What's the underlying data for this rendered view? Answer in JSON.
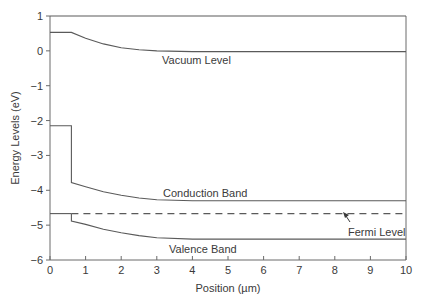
{
  "chart_data": {
    "type": "line",
    "title": "",
    "xlabel": "Position (µm)",
    "ylabel": "Energy Levels (eV)",
    "xlim": [
      0,
      10
    ],
    "ylim": [
      -6,
      1
    ],
    "xticks": [
      "0",
      "1",
      "2",
      "3",
      "4",
      "5",
      "6",
      "7",
      "8",
      "9",
      "10"
    ],
    "yticks": [
      "1",
      "0",
      "−1",
      "−2",
      "−3",
      "−4",
      "−5",
      "−6"
    ],
    "grid": false,
    "series": [
      {
        "name": "Vacuum Level",
        "label_position": [
          3.0,
          -0.25
        ],
        "points": [
          [
            0,
            0.53
          ],
          [
            0.6,
            0.53
          ],
          [
            1.0,
            0.36
          ],
          [
            1.5,
            0.2
          ],
          [
            2.0,
            0.09
          ],
          [
            2.5,
            0.03
          ],
          [
            3.0,
            0.0
          ],
          [
            4,
            -0.02
          ],
          [
            10,
            -0.02
          ]
        ],
        "style": "solid"
      },
      {
        "name": "Conduction Band",
        "label_position": [
          3.2,
          -4.05
        ],
        "points": [
          [
            0,
            -2.15
          ],
          [
            0.6,
            -2.15
          ],
          [
            0.6,
            -3.78
          ],
          [
            1.0,
            -3.9
          ],
          [
            1.5,
            -4.04
          ],
          [
            2.0,
            -4.14
          ],
          [
            2.5,
            -4.22
          ],
          [
            3.0,
            -4.27
          ],
          [
            4.0,
            -4.3
          ],
          [
            10,
            -4.3
          ]
        ],
        "style": "solid"
      },
      {
        "name": "Fermi Level",
        "label_position": [
          8.3,
          -5.15
        ],
        "points": [
          [
            0,
            -4.67
          ],
          [
            0.6,
            -4.67
          ]
        ],
        "dashed_points": [
          [
            0.6,
            -4.67
          ],
          [
            10,
            -4.67
          ]
        ],
        "style": "dashed",
        "annotation_arrow": {
          "from": [
            8.05,
            -5.0
          ],
          "to": [
            7.8,
            -4.72
          ]
        }
      },
      {
        "name": "Valence Band",
        "label_position": [
          3.3,
          -5.6
        ],
        "points": [
          [
            0.6,
            -4.67
          ],
          [
            0.6,
            -4.88
          ],
          [
            1.0,
            -4.98
          ],
          [
            1.5,
            -5.12
          ],
          [
            2.0,
            -5.22
          ],
          [
            2.5,
            -5.3
          ],
          [
            3.0,
            -5.36
          ],
          [
            4.0,
            -5.4
          ],
          [
            10,
            -5.4
          ]
        ],
        "style": "solid"
      },
      {
        "name": "Top reference line",
        "points": [
          [
            0,
            1
          ],
          [
            10,
            1
          ]
        ],
        "style": "solid"
      }
    ],
    "legend": "none (inline labels)"
  },
  "labels": {
    "vacuum": "Vacuum Level",
    "conduction": "Conduction Band",
    "fermi": "Fermi Level",
    "valence": "Valence Band",
    "xlabel": "Position (µm)",
    "ylabel": "Energy Levels (eV)"
  },
  "colors": {
    "line": "#5a5a5a",
    "axis": "#6a6a6a",
    "text": "#3a3a3a"
  }
}
